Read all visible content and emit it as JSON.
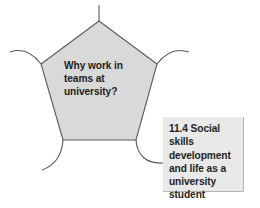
{
  "figure": {
    "background_color": "#ffffff",
    "pentagon": {
      "shape": "pentagon",
      "fill_color": "#d9d9d9",
      "stroke_color": "#58595b",
      "question_text": "Why work in teams at university?",
      "vertex_connectors": [
        {
          "name": "top-connector",
          "type": "straight-line"
        },
        {
          "name": "left-connector",
          "type": "curve"
        },
        {
          "name": "right-connector",
          "type": "curve"
        },
        {
          "name": "bottom-left-connector",
          "type": "curve"
        },
        {
          "name": "bottom-right-connector",
          "type": "curve"
        }
      ]
    },
    "callout": {
      "fill_color": "#e9e9e9",
      "shadow_color": "#bcbcbc",
      "text_color": "#231f20",
      "section_number": "11.4",
      "label": "11.4 Social skills development and life as a university student"
    }
  }
}
